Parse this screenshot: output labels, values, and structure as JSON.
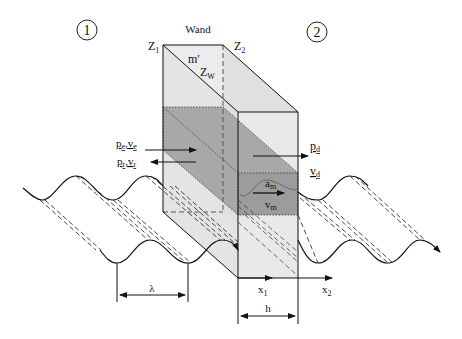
{
  "title": "Wand",
  "regions": {
    "left": "1",
    "right": "2"
  },
  "wall_labels": {
    "z1": "Z",
    "z1_sub": "1",
    "z2": "Z",
    "z2_sub": "2",
    "mass": "m′",
    "zw": "Z",
    "zw_sub": "W"
  },
  "wave_labels": {
    "incident": "p",
    "incident_sub": "e",
    "incident_v": "v",
    "incident_v_sub": "e",
    "reflected": "p",
    "reflected_sub": "r",
    "reflected_v": "v",
    "reflected_v_sub": "r",
    "transmitted_p": "p",
    "transmitted_p_sub": "d",
    "transmitted_v": "v",
    "transmitted_v_sub": "d",
    "accel": "a",
    "accel_sub": "m",
    "velocity": "v",
    "velocity_sub": "m",
    "comma": ","
  },
  "dimensions": {
    "wavelength": "λ",
    "thickness": "h",
    "x1": "x",
    "x1_sub": "1",
    "x2": "x",
    "x2_sub": "2"
  },
  "colors": {
    "wall_light": "#ececec",
    "wall_side": "#dcdcdc",
    "slab_dark": "#a9a9a9",
    "slab_front": "#9a9a9a",
    "line": "#111111"
  }
}
